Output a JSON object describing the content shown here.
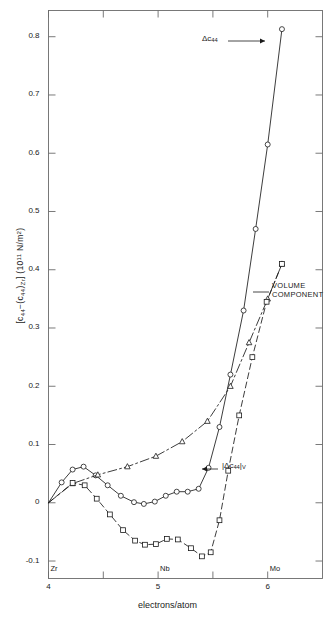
{
  "chart_data": {
    "type": "line",
    "title": "",
    "xlabel": "electrons/atom",
    "ylabel": "[c44-(c44)Zr] (10^11 N/m^2)",
    "ylabel_parts": {
      "open_bracket": "[",
      "c44": "c",
      "c44_sub": "44",
      "minus": "−(",
      "c44b": "c",
      "c44b_sub": "44",
      "close_paren": ")",
      "zr_sub": "Zr",
      "close_bracket": "] (10",
      "exp": "11",
      "units": " N/m",
      "units_sup": "2",
      "tail": ")"
    },
    "xlim": [
      4,
      6.5
    ],
    "ylim": [
      -0.13,
      0.845
    ],
    "grid": false,
    "legend_position": "inline-annotations",
    "x_ticks": [
      {
        "value": 4,
        "label": "4",
        "element": "Zr"
      },
      {
        "value": 4.5,
        "label": "",
        "element": ""
      },
      {
        "value": 5,
        "label": "5",
        "element": "Nb"
      },
      {
        "value": 5.5,
        "label": "",
        "element": ""
      },
      {
        "value": 6,
        "label": "6",
        "element": "Mo"
      }
    ],
    "y_ticks": [
      {
        "value": 0.8,
        "label": "0.8"
      },
      {
        "value": 0.7,
        "label": "0.7"
      },
      {
        "value": 0.6,
        "label": "0.6"
      },
      {
        "value": 0.5,
        "label": "0.5"
      },
      {
        "value": 0.4,
        "label": "0.4"
      },
      {
        "value": 0.3,
        "label": "0.3"
      },
      {
        "value": 0.2,
        "label": "0.2"
      },
      {
        "value": 0.1,
        "label": "0.1"
      },
      {
        "value": 0.0,
        "label": "0"
      },
      {
        "value": -0.1,
        "label": "-0.1"
      }
    ],
    "series": [
      {
        "name": "delta-c44",
        "label": "Δc₄₄",
        "marker": "circle-open",
        "linestyle": "solid",
        "color": "#1a1a1a",
        "points": [
          [
            4.0,
            0.0
          ],
          [
            4.12,
            0.035
          ],
          [
            4.22,
            0.057
          ],
          [
            4.32,
            0.062
          ],
          [
            4.43,
            0.047
          ],
          [
            4.54,
            0.03
          ],
          [
            4.66,
            0.012
          ],
          [
            4.78,
            0.001
          ],
          [
            4.87,
            -0.002
          ],
          [
            4.97,
            0.002
          ],
          [
            5.07,
            0.012
          ],
          [
            5.17,
            0.019
          ],
          [
            5.27,
            0.019
          ],
          [
            5.37,
            0.024
          ],
          [
            5.46,
            0.06
          ],
          [
            5.56,
            0.13
          ],
          [
            5.66,
            0.22
          ],
          [
            5.78,
            0.33
          ],
          [
            5.89,
            0.47
          ],
          [
            6.0,
            0.615
          ],
          [
            6.13,
            0.813
          ]
        ]
      },
      {
        "name": "volume-component",
        "label": "VOLUME COMPONENT",
        "marker": "triangle-open",
        "linestyle": "dashdot",
        "color": "#1a1a1a",
        "points": [
          [
            4.0,
            0.0
          ],
          [
            4.22,
            0.033
          ],
          [
            4.45,
            0.048
          ],
          [
            4.72,
            0.062
          ],
          [
            4.98,
            0.08
          ],
          [
            5.22,
            0.105
          ],
          [
            5.45,
            0.14
          ],
          [
            5.66,
            0.2
          ],
          [
            5.83,
            0.275
          ],
          [
            6.0,
            0.35
          ],
          [
            6.13,
            0.41
          ]
        ]
      },
      {
        "name": "abs-delta-c44-v",
        "label": "|Δc₄₄|ᵥ",
        "marker": "square-open",
        "linestyle": "dashed",
        "color": "#1a1a1a",
        "points": [
          [
            4.0,
            0.0
          ],
          [
            4.22,
            0.034
          ],
          [
            4.33,
            0.03
          ],
          [
            4.44,
            0.007
          ],
          [
            4.56,
            -0.02
          ],
          [
            4.68,
            -0.047
          ],
          [
            4.79,
            -0.065
          ],
          [
            4.88,
            -0.072
          ],
          [
            4.98,
            -0.071
          ],
          [
            5.08,
            -0.062
          ],
          [
            5.18,
            -0.063
          ],
          [
            5.3,
            -0.078
          ],
          [
            5.4,
            -0.092
          ],
          [
            5.48,
            -0.085
          ],
          [
            5.56,
            -0.03
          ],
          [
            5.64,
            0.055
          ],
          [
            5.74,
            0.15
          ],
          [
            5.86,
            0.25
          ],
          [
            5.99,
            0.345
          ],
          [
            6.13,
            0.41
          ]
        ]
      }
    ],
    "annotations": [
      {
        "name": "delta-c44-annotation",
        "text": "Δc₄₄",
        "text_x": 202,
        "text_y": 34,
        "arrow_from": [
          228,
          41
        ],
        "arrow_to": [
          265,
          41
        ]
      },
      {
        "name": "volume-component-annotation",
        "line1": "VOLUME",
        "line2": "COMPONENT",
        "text_x": 272,
        "text_y": 281,
        "arrow_from": [
          269,
          292
        ],
        "arrow_to": [
          253,
          292
        ]
      },
      {
        "name": "abs-delta-c44-v-annotation",
        "text": "|Δc₄₄|",
        "sub": "V",
        "text_x": 222,
        "text_y": 461,
        "arrow_from": [
          218,
          469
        ],
        "arrow_to": [
          202,
          469
        ]
      }
    ]
  }
}
